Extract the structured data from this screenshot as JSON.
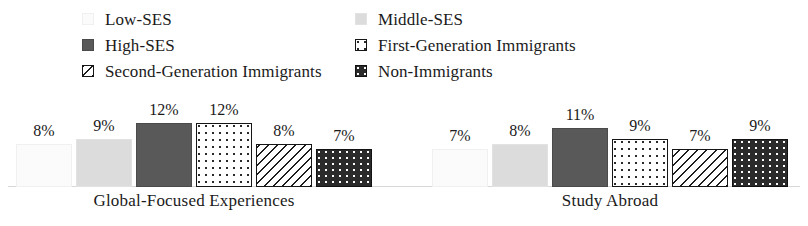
{
  "legend": {
    "columns": [
      {
        "items": [
          {
            "label": "Low-SES",
            "swatch": "low-ses-swatch",
            "fill": "fill-lowses"
          },
          {
            "label": "High-SES",
            "swatch": "high-ses-swatch",
            "fill": "fill-highses"
          },
          {
            "label": "Second-Generation Immigrants",
            "swatch": "second-generation-immigrants-swatch",
            "fill": "fill-secondgen"
          }
        ]
      },
      {
        "items": [
          {
            "label": "Middle-SES",
            "swatch": "middle-ses-swatch",
            "fill": "fill-middleses"
          },
          {
            "label": "First-Generation Immigrants",
            "swatch": "first-generation-immigrants-swatch",
            "fill": "fill-firstgen"
          },
          {
            "label": "Non-Immigrants",
            "swatch": "non-immigrants-swatch",
            "fill": "fill-nonimm"
          }
        ]
      }
    ]
  },
  "chart_data": {
    "type": "bar",
    "title": "",
    "xlabel": "",
    "ylabel": "",
    "ylim": [
      0,
      14
    ],
    "grid": false,
    "legend_position": "top",
    "categories": [
      "Global-Focused Experiences",
      "Study Abroad"
    ],
    "series": [
      {
        "name": "Low-SES",
        "fill": "fill-lowses",
        "values": [
          8,
          7
        ],
        "labels": [
          "8%",
          "7%"
        ]
      },
      {
        "name": "Middle-SES",
        "fill": "fill-middleses",
        "values": [
          9,
          8
        ],
        "labels": [
          "9%",
          "8%"
        ]
      },
      {
        "name": "High-SES",
        "fill": "fill-highses",
        "values": [
          12,
          11
        ],
        "labels": [
          "12%",
          "11%"
        ]
      },
      {
        "name": "First-Generation Immigrants",
        "fill": "fill-firstgen",
        "values": [
          12,
          9
        ],
        "labels": [
          "12%",
          "9%"
        ]
      },
      {
        "name": "Second-Generation Immigrants",
        "fill": "fill-secondgen",
        "values": [
          8,
          7
        ],
        "labels": [
          "8%",
          "7%"
        ]
      },
      {
        "name": "Non-Immigrants",
        "fill": "fill-nonimm",
        "values": [
          7,
          9
        ],
        "labels": [
          "7%",
          "9%"
        ]
      }
    ]
  }
}
